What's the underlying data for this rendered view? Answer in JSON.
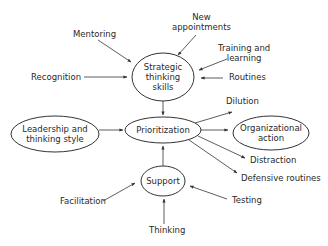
{
  "diagram": {
    "nodes": {
      "strategic": {
        "line1": "Strategic",
        "line2": "thinking",
        "line3": "skills"
      },
      "prioritization": {
        "label": "Prioritization"
      },
      "leadership": {
        "line1": "Leadership and",
        "line2": "thinking style"
      },
      "organizational": {
        "line1": "Organizational",
        "line2": "action"
      },
      "support": {
        "label": "Support"
      }
    },
    "inputs_to_strategic": {
      "mentoring": "Mentoring",
      "new_appointments_1": "New",
      "new_appointments_2": "appointments",
      "training_1": "Training and",
      "training_2": "learning",
      "recognition": "Recognition",
      "routines": "Routines"
    },
    "outputs_from_prioritization": {
      "dilution": "Dilution",
      "distraction": "Distraction",
      "defensive_routines": "Defensive routines"
    },
    "inputs_to_support": {
      "facilitation": "Facilitation",
      "testing": "Testing",
      "thinking": "Thinking"
    },
    "colors": {
      "stroke": "#333333",
      "text": "#2a2a2a",
      "background": "#ffffff"
    }
  }
}
